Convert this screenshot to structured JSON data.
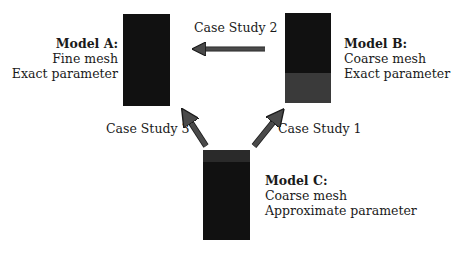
{
  "models": {
    "a": {
      "title": "Model A:",
      "mesh": "Fine mesh",
      "parameter": "Exact parameter",
      "box_color": "#111111"
    },
    "b": {
      "title": "Model B:",
      "mesh": "Coarse mesh",
      "parameter": "Exact parameter",
      "box_color": "#0f0f0f",
      "shade_color": "#3a3a3a"
    },
    "c": {
      "title": "Model C:",
      "mesh": "Coarse mesh",
      "parameter": "Approximate parameter",
      "box_color": "#131313",
      "shade_color": "#2a2a2a"
    }
  },
  "edges": [
    {
      "label": "Case Study 1",
      "from": "Model C",
      "to": "Model B"
    },
    {
      "label": "Case Study 2",
      "from": "Model B",
      "to": "Model A"
    },
    {
      "label": "Case Study 3",
      "from": "Model C",
      "to": "Model A"
    }
  ],
  "arrow_color": "#4a4a4a"
}
